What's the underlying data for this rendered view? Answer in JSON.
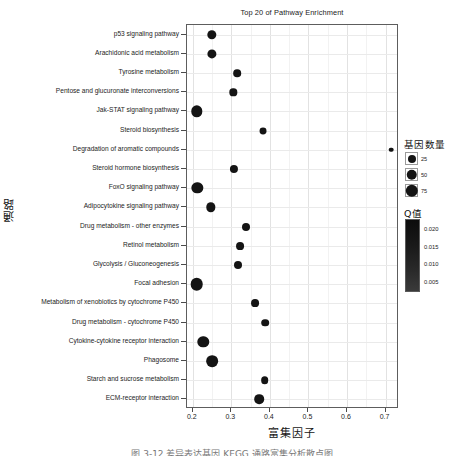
{
  "chart_data": {
    "type": "scatter",
    "title": "Top 20 of Pathway Enrichment",
    "xlabel": "富集因子",
    "ylabel": "通路",
    "xlim": [
      0.185,
      0.735
    ],
    "ylim": [
      0,
      21
    ],
    "grid": true,
    "xticks": [
      0.2,
      0.3,
      0.4,
      0.5,
      0.6,
      0.7
    ],
    "xticklabels": [
      "0.2",
      "0.3",
      "0.4",
      "0.5",
      "0.6",
      "0.7"
    ],
    "categories": [
      "p53 signaling pathway",
      "Arachidonic acid metabolism",
      "Tyrosine metabolism",
      "Pentose and glucuronate interconversions",
      "Jak-STAT signaling pathway",
      "Steroid biosynthesis",
      "Degradation of aromatic compounds",
      "Steroid hormone biosynthesis",
      "FoxO signaling pathway",
      "Adipocytokine signaling pathway",
      "Drug metabolism - other enzymes",
      "Retinol metabolism",
      "Glycolysis / Gluconeogenesis",
      "Focal adhesion",
      "Metabolism of xenobiotics by cytochrome P450",
      "Drug metabolism - cytochrome P450",
      "Cytokine-cytokine receptor interaction",
      "Phagosome",
      "Starch and sucrose metabolism",
      "ECM-receptor interaction"
    ],
    "points": [
      {
        "category": "p53 signaling pathway",
        "x": 0.25,
        "gene_number": 38,
        "qvalue": 0.004
      },
      {
        "category": "Arachidonic acid metabolism",
        "x": 0.25,
        "gene_number": 36,
        "qvalue": 0.004
      },
      {
        "category": "Tyrosine metabolism",
        "x": 0.315,
        "gene_number": 22,
        "qvalue": 0.004
      },
      {
        "category": "Pentose and glucuronate interconversions",
        "x": 0.305,
        "gene_number": 20,
        "qvalue": 0.004
      },
      {
        "category": "Jak-STAT signaling pathway",
        "x": 0.211,
        "gene_number": 62,
        "qvalue": 0.003
      },
      {
        "category": "Steroid biosynthesis",
        "x": 0.383,
        "gene_number": 17,
        "qvalue": 0.004
      },
      {
        "category": "Degradation of aromatic compounds",
        "x": 0.715,
        "gene_number": 5,
        "qvalue": 0.012
      },
      {
        "category": "Steroid hormone biosynthesis",
        "x": 0.307,
        "gene_number": 26,
        "qvalue": 0.004
      },
      {
        "category": "FoxO signaling pathway",
        "x": 0.212,
        "gene_number": 60,
        "qvalue": 0.003
      },
      {
        "category": "Adipocytokine signaling pathway",
        "x": 0.246,
        "gene_number": 38,
        "qvalue": 0.004
      },
      {
        "category": "Drug metabolism - other enzymes",
        "x": 0.337,
        "gene_number": 25,
        "qvalue": 0.004
      },
      {
        "category": "Retinol metabolism",
        "x": 0.322,
        "gene_number": 24,
        "qvalue": 0.004
      },
      {
        "category": "Glycolysis / Gluconeogenesis",
        "x": 0.317,
        "gene_number": 25,
        "qvalue": 0.004
      },
      {
        "category": "Focal adhesion",
        "x": 0.21,
        "gene_number": 78,
        "qvalue": 0.002
      },
      {
        "category": "Metabolism of xenobiotics by cytochrome P450",
        "x": 0.362,
        "gene_number": 24,
        "qvalue": 0.004
      },
      {
        "category": "Drug metabolism - cytochrome P450",
        "x": 0.388,
        "gene_number": 22,
        "qvalue": 0.004
      },
      {
        "category": "Cytokine-cytokine receptor interaction",
        "x": 0.227,
        "gene_number": 62,
        "qvalue": 0.003
      },
      {
        "category": "Phagosome",
        "x": 0.25,
        "gene_number": 65,
        "qvalue": 0.003
      },
      {
        "category": "Starch and sucrose metabolism",
        "x": 0.387,
        "gene_number": 22,
        "qvalue": 0.004
      },
      {
        "category": "ECM-receptor interaction",
        "x": 0.373,
        "gene_number": 40,
        "qvalue": 0.004
      }
    ],
    "size_legend": {
      "title": "基因数量",
      "entries": [
        "25",
        "50",
        "75"
      ],
      "values": [
        25,
        50,
        75
      ]
    },
    "color_legend": {
      "title": "Q值",
      "ticks": [
        "0.020",
        "0.015",
        "0.010",
        "0.005"
      ],
      "values": [
        0.02,
        0.015,
        0.01,
        0.005
      ],
      "high_color": "#3a3a3a",
      "low_color": "#0c0c0c"
    },
    "dot_color": "#141414",
    "grid_color": "#e5e5e5",
    "panel_border_color": "#5d5d5d"
  },
  "caption": "图 3-12  差异表达基因 KEGG 通路富集分析散点图"
}
